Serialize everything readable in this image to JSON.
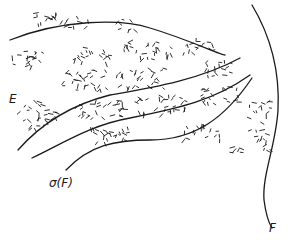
{
  "figure": {
    "type": "hand-drawn diagram of nested curves with stippled regions",
    "labels": {
      "E": "E",
      "sigma_F": "σ(F)",
      "F": "F"
    },
    "colors": {
      "ink": "#1a1a1a",
      "background": "#ffffff"
    },
    "curves": [
      {
        "name": "curve-1-top",
        "path": "M10,40 C60,20 120,18 150,28 C190,40 220,55 225,55"
      },
      {
        "name": "curve-2",
        "path": "M18,150 C40,125 70,105 110,95 C150,88 200,80 240,58"
      },
      {
        "name": "curve-3",
        "path": "M32,158 C60,145 90,125 130,118 C180,108 215,100 250,75"
      },
      {
        "name": "curve-4-sigmaF",
        "path": "M66,170 C90,145 115,140 150,140 C195,140 225,118 252,78"
      },
      {
        "name": "curve-F-vertical",
        "path": "M252,5 C270,35 280,70 278,110 C276,145 262,175 264,200 C266,215 270,225 272,228"
      }
    ]
  }
}
